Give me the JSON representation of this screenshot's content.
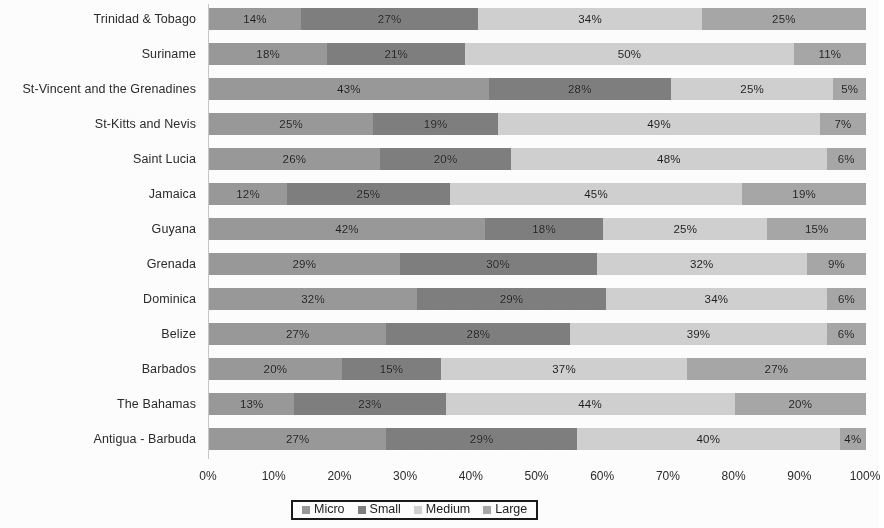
{
  "chart_data": {
    "type": "bar",
    "orientation": "horizontal",
    "stacked": true,
    "normalized_percent": true,
    "title": "",
    "subtitle": "",
    "xlabel": "",
    "ylabel": "",
    "xlim": [
      0,
      100
    ],
    "grid": false,
    "legend_position": "bottom",
    "value_label_suffix": "%",
    "categories": [
      "Trinidad & Tobago",
      "Suriname",
      "St-Vincent and the Grenadines",
      "St-Kitts and Nevis",
      "Saint Lucia",
      "Jamaica",
      "Guyana",
      "Grenada",
      "Dominica",
      "Belize",
      "Barbados",
      "The Bahamas",
      "Antigua - Barbuda"
    ],
    "series": [
      {
        "name": "Micro",
        "color": "#9a9a9a",
        "values": [
          14,
          18,
          43,
          25,
          26,
          12,
          42,
          29,
          32,
          27,
          20,
          13,
          27
        ],
        "labels": [
          "14%",
          "18%",
          "43%",
          "25%",
          "26%",
          "12%",
          "42%",
          "29%",
          "32%",
          "27%",
          "20%",
          "13%",
          "27%"
        ]
      },
      {
        "name": "Small",
        "color": "#808080",
        "values": [
          27,
          21,
          28,
          19,
          20,
          25,
          18,
          30,
          29,
          28,
          15,
          23,
          29
        ],
        "labels": [
          "27%",
          "21%",
          "28%",
          "19%",
          "20%",
          "25%",
          "18%",
          "30%",
          "29%",
          "28%",
          "15%",
          "23%",
          "29%"
        ]
      },
      {
        "name": "Medium",
        "color": "#d2d2d2",
        "values": [
          34,
          50,
          25,
          49,
          48,
          45,
          25,
          32,
          34,
          39,
          37,
          44,
          40
        ],
        "labels": [
          "34%",
          "50%",
          "25%",
          "49%",
          "48%",
          "45%",
          "25%",
          "32%",
          "34%",
          "39%",
          "37%",
          "44%",
          "40%"
        ]
      },
      {
        "name": "Large",
        "color": "#a8a8a8",
        "values": [
          25,
          11,
          5,
          7,
          6,
          19,
          15,
          9,
          6,
          6,
          27,
          20,
          4
        ],
        "labels": [
          "25%",
          "11%",
          "5%",
          "7%",
          "6%",
          "19%",
          "15%",
          "9%",
          "6%",
          "6%",
          "27%",
          "20%",
          "4%"
        ]
      }
    ],
    "x_ticks": [
      "0%",
      "10%",
      "20%",
      "30%",
      "40%",
      "50%",
      "60%",
      "70%",
      "80%",
      "90%",
      "100%"
    ],
    "x_tick_values": [
      0,
      10,
      20,
      30,
      40,
      50,
      60,
      70,
      80,
      90,
      100
    ]
  },
  "legend": {
    "items": [
      {
        "label": "Micro"
      },
      {
        "label": "Small"
      },
      {
        "label": "Medium"
      },
      {
        "label": "Large"
      }
    ]
  }
}
